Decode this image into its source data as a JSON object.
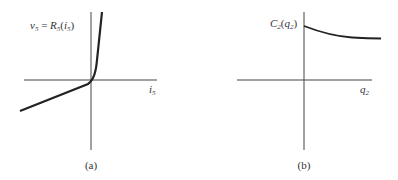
{
  "panels": [
    {
      "id": "a",
      "caption": "(a)",
      "y_label": {
        "lhs": "v",
        "lhs_sub": "5",
        "eq": " = ",
        "fn": "R",
        "fn_sub": "5",
        "arg_open": "(",
        "arg": "i",
        "arg_sub": "5",
        "arg_close": ")"
      },
      "x_label": {
        "base": "i",
        "sub": "5"
      },
      "curve": "piecewise: shallow linear slope for negative current, steep rise for positive current (diode-like resistor characteristic)"
    },
    {
      "id": "b",
      "caption": "(b)",
      "y_label": {
        "base": "C",
        "sub": "2",
        "open": "(",
        "arg": "q",
        "arg_sub": "2",
        "close": ")"
      },
      "x_label": {
        "base": "q",
        "sub": "2"
      },
      "curve": "decreasing convex curve for positive charge, starting at positive value and leveling off"
    }
  ],
  "colors": {
    "ink": "#222222",
    "axis": "#444444",
    "background": "#ffffff"
  }
}
